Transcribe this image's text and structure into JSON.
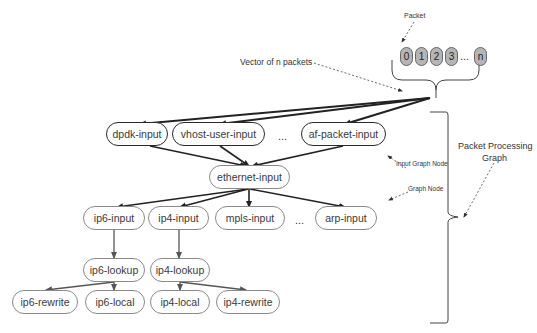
{
  "labels": {
    "packet": "Packet",
    "vector": "Vector of n packets",
    "input_graph_node": "Input Graph Node",
    "graph_node": "Graph Node",
    "packet_processing_graph_line1": "Packet Processing",
    "packet_processing_graph_line2": "Graph"
  },
  "packets": [
    "0",
    "1",
    "2",
    "3",
    "n"
  ],
  "packet_ellipsis": "...",
  "nodes": {
    "dpdk_input": "dpdk-input",
    "vhost_user_input": "vhost-user-input",
    "af_packet_input": "af-packet-input",
    "ethernet_input": "ethernet-input",
    "ip6_input": "ip6-input",
    "ip4_input": "ip4-input",
    "mpls_input": "mpls-input",
    "arp_input": "arp-input",
    "ip6_lookup": "ip6-lookup",
    "ip4_lookup": "ip4-lookup",
    "ip6_rewrite": "ip6-rewrite",
    "ip6_local": "ip6-local",
    "ip4_local": "ip4-local",
    "ip4_rewrite": "ip4-rewrite"
  },
  "ellipsis": {
    "input_row": "...",
    "protocol_row": "..."
  },
  "edges": [
    [
      "vector",
      "dpdk-input"
    ],
    [
      "vector",
      "vhost-user-input"
    ],
    [
      "vector",
      "af-packet-input"
    ],
    [
      "dpdk-input",
      "ethernet-input"
    ],
    [
      "vhost-user-input",
      "ethernet-input"
    ],
    [
      "af-packet-input",
      "ethernet-input"
    ],
    [
      "ethernet-input",
      "ip6-input"
    ],
    [
      "ethernet-input",
      "ip4-input"
    ],
    [
      "ethernet-input",
      "mpls-input"
    ],
    [
      "ethernet-input",
      "arp-input"
    ],
    [
      "ip6-input",
      "ip6-lookup"
    ],
    [
      "ip4-input",
      "ip4-lookup"
    ],
    [
      "ip6-lookup",
      "ip6-rewrite"
    ],
    [
      "ip6-lookup",
      "ip6-local"
    ],
    [
      "ip4-lookup",
      "ip4-local"
    ],
    [
      "ip4-lookup",
      "ip4-rewrite"
    ]
  ]
}
